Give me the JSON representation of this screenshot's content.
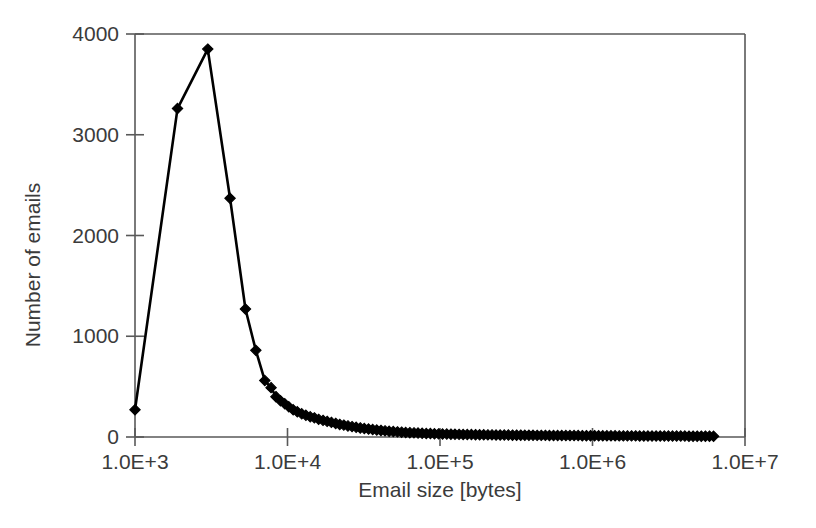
{
  "chart_data": {
    "type": "line",
    "title": "",
    "xlabel": "Email size [bytes]",
    "ylabel": "Number of emails",
    "xscale": "log",
    "yscale": "linear",
    "xlim": [
      1000,
      10000000
    ],
    "ylim": [
      0,
      4000
    ],
    "grid": false,
    "legend": null,
    "marker": "diamond",
    "marker_color": "#000000",
    "line_color": "#000000",
    "background": "#ffffff",
    "frame_color": "#595959",
    "xtick_labels": [
      "1.0E+3",
      "1.0E+4",
      "1.0E+5",
      "1.0E+6",
      "1.0E+7"
    ],
    "xtick_values": [
      1000,
      10000,
      100000,
      1000000,
      10000000
    ],
    "ytick_labels": [
      "0",
      "1000",
      "2000",
      "3000",
      "4000"
    ],
    "ytick_values": [
      0,
      1000,
      2000,
      3000,
      4000
    ],
    "series": [
      {
        "name": "Email size distribution",
        "x": [
          1000,
          1900,
          3000,
          4200,
          5300,
          6200,
          7100,
          7800,
          8400,
          9000,
          9600,
          10200,
          10900,
          11600,
          12400,
          13200,
          14100,
          15000,
          16000,
          17100,
          18200,
          19400,
          20700,
          22000,
          23400,
          24900,
          26500,
          28200,
          30000,
          31900,
          34000,
          36200,
          38500,
          41000,
          43600,
          46400,
          49400,
          52600,
          56000,
          59600,
          63400,
          67500,
          71800,
          76400,
          81300,
          86500,
          92000,
          97900,
          104000,
          110800,
          117900,
          125400,
          133400,
          141900,
          151000,
          160700,
          171000,
          182000,
          193600,
          206000,
          219200,
          233200,
          248100,
          264000,
          280900,
          298900,
          318000,
          338300,
          360000,
          383000,
          407500,
          433500,
          461200,
          490700,
          522100,
          555500,
          591000,
          628800,
          669000,
          711800,
          757300,
          805700,
          857200,
          912000,
          970300,
          1032000,
          1098000,
          1168000,
          1243000,
          1322000,
          1407000,
          1497000,
          1593000,
          1694000,
          1803000,
          1918000,
          2040000,
          2171000,
          2310000,
          2457000,
          2614000,
          2781000,
          2959000,
          3148000,
          3349000,
          3563000,
          3791000,
          4033000,
          4291000,
          4565000,
          4857000,
          5167000,
          5497000,
          5848000,
          6222000
        ],
        "y": [
          270,
          3260,
          3850,
          2370,
          1270,
          860,
          560,
          490,
          400,
          360,
          330,
          300,
          270,
          250,
          230,
          215,
          200,
          190,
          175,
          165,
          155,
          145,
          135,
          125,
          118,
          110,
          103,
          96,
          90,
          84,
          79,
          74,
          69,
          65,
          61,
          57,
          54,
          51,
          48,
          45,
          43,
          41,
          39,
          37,
          35,
          34,
          32,
          31,
          30,
          29,
          28,
          27,
          26,
          25,
          24,
          24,
          23,
          22,
          22,
          21,
          21,
          20,
          20,
          19,
          19,
          18,
          18,
          18,
          17,
          17,
          17,
          16,
          16,
          16,
          15,
          15,
          15,
          15,
          14,
          14,
          14,
          14,
          13,
          13,
          13,
          13,
          12,
          12,
          12,
          12,
          12,
          11,
          11,
          11,
          11,
          11,
          10,
          10,
          10,
          10,
          10,
          10,
          9,
          9,
          9,
          9,
          9,
          9,
          8,
          8,
          8,
          8,
          8,
          8,
          7
        ]
      }
    ],
    "annotations": [
      {
        "text": "peak",
        "x": 3000,
        "y": 3850,
        "note": "maximum number of emails"
      }
    ]
  }
}
